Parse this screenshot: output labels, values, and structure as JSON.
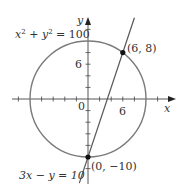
{
  "diagram": {
    "type": "circle-line-intersection",
    "colors": {
      "circle": "#7a7a7a",
      "line": "#555555",
      "axes": "#444444",
      "points": "#111111",
      "text": "#333333"
    },
    "axes": {
      "x_label": "x",
      "y_label": "y",
      "origin_label": "0",
      "x_tick_label": "6",
      "y_tick_label": "6",
      "tick_step": 2
    },
    "circle": {
      "equation_lhs": "x",
      "equation_sup1": "2",
      "equation_plus": " + y",
      "equation_sup2": "2",
      "equation_rhs": " = 100",
      "center": [
        0,
        0
      ],
      "radius": 10
    },
    "line": {
      "equation": "3x − y = 10"
    },
    "points": [
      {
        "label": "(6, 8)",
        "x": 6,
        "y": 8
      },
      {
        "label": "(0, −10)",
        "x": 0,
        "y": -10
      }
    ]
  }
}
